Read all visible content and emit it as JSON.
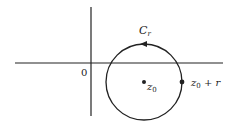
{
  "diagram": {
    "title": "",
    "labels": {
      "origin": "0",
      "contour_main": "C",
      "contour_sub": "r",
      "center_main": "z",
      "center_sub": "0",
      "point_main": "z",
      "point_sub": "0",
      "point_suffix": " + r"
    },
    "geometry": {
      "x_axis": {
        "x1": 15,
        "x2": 223,
        "y": 63
      },
      "y_axis": {
        "x": 91,
        "y1": 7,
        "y2": 116
      },
      "circle": {
        "cx": 144,
        "cy": 82,
        "r": 38
      },
      "center_point": {
        "x": 144,
        "y": 82
      },
      "edge_point": {
        "x": 182,
        "y": 82
      },
      "arrow_direction": "counterclockwise"
    },
    "colors": {
      "stroke": "#222222",
      "background": "#ffffff"
    }
  }
}
